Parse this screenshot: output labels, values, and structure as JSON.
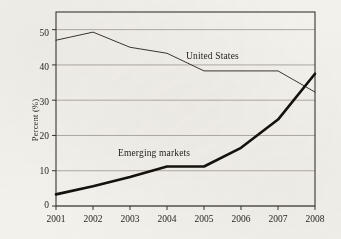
{
  "chart_data": {
    "type": "line",
    "title": "",
    "subtitle": "",
    "xlabel": "",
    "ylabel": "Percent (%)",
    "x": [
      2001,
      2002,
      2003,
      2004,
      2005,
      2006,
      2007,
      2008
    ],
    "xlim": [
      2001,
      2008
    ],
    "ylim": [
      0,
      55
    ],
    "ytick_values": [
      0,
      10,
      20,
      30,
      40,
      50
    ],
    "ytick_labels": [
      "0",
      "10",
      "20",
      "30",
      "40",
      "50"
    ],
    "xtick_labels": [
      "2001",
      "2002",
      "2003",
      "2004",
      "2005",
      "2006",
      "2007",
      "2008"
    ],
    "grid": "horizontal",
    "legend_position": "inline-annotations",
    "series": [
      {
        "name": "United States",
        "style": "thin",
        "color": "#2f2b26",
        "values": [
          47.0,
          49.3,
          45.0,
          43.3,
          38.3,
          38.3,
          38.3,
          32.3
        ]
      },
      {
        "name": "Emerging markets",
        "style": "thick",
        "color": "#14110e",
        "values": [
          3.3,
          5.6,
          8.2,
          11.2,
          11.2,
          16.5,
          24.5,
          37.5
        ]
      }
    ],
    "annotations": [
      {
        "text": "United States",
        "series": "United States"
      },
      {
        "text": "Emerging markets",
        "series": "Emerging markets"
      }
    ]
  },
  "axes": {
    "ylabel": "Percent (%)",
    "ytick_labels": [
      "50",
      "40",
      "30",
      "20",
      "10",
      "0"
    ],
    "xtick_labels": [
      "2001",
      "2002",
      "2003",
      "2004",
      "2005",
      "2006",
      "2007",
      "2008"
    ]
  },
  "annotations": {
    "united_states": "United States",
    "emerging_markets": "Emerging markets"
  },
  "colors": {
    "background": "#f3f1ec",
    "frame": "#3a352f",
    "gridline": "#9a958d",
    "line_us": "#2f2b26",
    "line_em": "#14110e",
    "text": "#2a2622"
  }
}
